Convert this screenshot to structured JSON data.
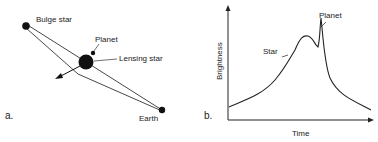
{
  "panel_a": {
    "letter": "a.",
    "labels": {
      "bulge_star": "Bulge star",
      "planet": "Planet",
      "lensing_star": "Lensing star",
      "earth": "Earth"
    }
  },
  "panel_b": {
    "letter": "b.",
    "xlabel": "Time",
    "ylabel": "Brightness",
    "annotations": {
      "star": "Star",
      "planet": "Planet"
    }
  }
}
